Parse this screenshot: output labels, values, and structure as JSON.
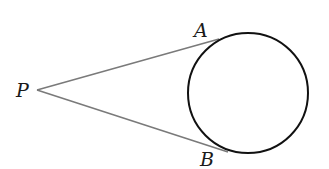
{
  "diagram": {
    "type": "geometry",
    "labels": {
      "P": "P",
      "A": "A",
      "B": "B"
    },
    "points": {
      "P": [
        37,
        90
      ],
      "A": [
        219,
        39
      ],
      "B": [
        226,
        152
      ]
    },
    "circle": {
      "cx": 248,
      "cy": 93,
      "r": 60
    },
    "colors": {
      "tangent_lines": "#7a7a7a",
      "circle": "#111111",
      "labels": "#1a1a1a"
    }
  }
}
